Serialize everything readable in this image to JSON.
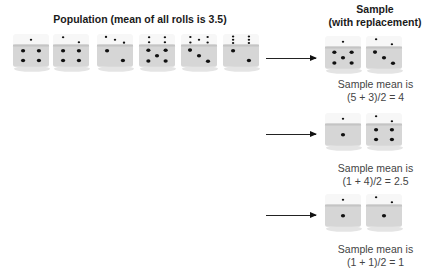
{
  "population": {
    "title": "Population (mean of all rolls is 3.5)",
    "dice": [
      {
        "top": 1,
        "front": 4
      },
      {
        "top": 2,
        "front": 4
      },
      {
        "top": 3,
        "front": 2
      },
      {
        "top": 4,
        "front": 5
      },
      {
        "top": 5,
        "front": 3
      },
      {
        "top": 6,
        "front": 2
      }
    ]
  },
  "sample": {
    "title_line1": "Sample",
    "title_line2": "(with replacement)",
    "rows": [
      {
        "dice_values": [
          5,
          3
        ],
        "caption_line1": "Sample mean is",
        "caption_line2": "(5 + 3)/2 = 4"
      },
      {
        "dice_values": [
          1,
          4
        ],
        "caption_line1": "Sample mean is",
        "caption_line2": "(1 + 4)/2 = 2.5"
      },
      {
        "dice_values": [
          1,
          1
        ],
        "caption_line1": "Sample mean is",
        "caption_line2": "(1 + 1)/2 = 1"
      }
    ]
  }
}
